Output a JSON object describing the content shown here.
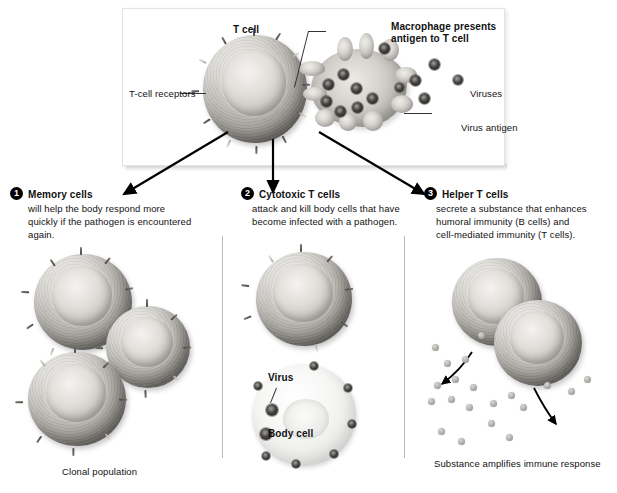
{
  "diagram": {
    "title_labels": {
      "t_cell": "T cell",
      "macrophage": "Macrophage presents\nantigen to T cell",
      "macrophage_line1": "Macrophage presents",
      "macrophage_line2": "antigen to T cell",
      "t_cell_receptors": "T-cell receptors",
      "viruses": "Viruses",
      "virus_antigen": "Virus antigen"
    },
    "branches": [
      {
        "number": "1",
        "heading": "Memory cells",
        "body_line1": "will help the body respond more",
        "body_line2": "quickly if the pathogen is encountered",
        "body_line3": "again.",
        "caption": "Clonal population"
      },
      {
        "number": "2",
        "heading": "Cytotoxic T cells",
        "body_line1": "attack and kill body cells that have",
        "body_line2": "become infected with a pathogen.",
        "inline_labels": {
          "virus": "Virus",
          "body_cell": "Body cell"
        }
      },
      {
        "number": "3",
        "heading": "Helper T cells",
        "body_line1": "secrete a substance that enhances",
        "body_line2": "humoral immunity (B cells) and",
        "body_line3": "cell-mediated immunity (T cells).",
        "caption": "Substance amplifies immune response"
      }
    ],
    "colors": {
      "text": "#111111",
      "badge_fill": "#000000",
      "badge_text": "#ffffff",
      "arrow": "#000000",
      "divider": "#b9b9b9",
      "panel_border": "#e3e3e3",
      "background": "#ffffff"
    }
  }
}
